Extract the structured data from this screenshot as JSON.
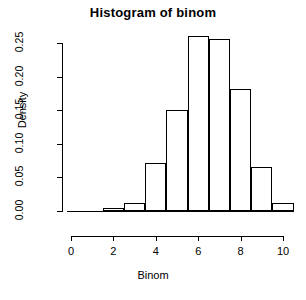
{
  "chart_data": {
    "type": "bar",
    "title": "Histogram of binom",
    "xlabel": "Binom",
    "ylabel": "Density",
    "grid": false,
    "legend": "none",
    "xlim": [
      0,
      10
    ],
    "ylim": [
      0,
      0.27
    ],
    "xticks": [
      0,
      2,
      4,
      6,
      8,
      10
    ],
    "xtick_labels": [
      "0",
      "2",
      "4",
      "6",
      "8",
      "10"
    ],
    "yticks": [
      0.0,
      0.05,
      0.1,
      0.15,
      0.2,
      0.25
    ],
    "ytick_labels": [
      "0.00",
      "0.05",
      "0.10",
      "0.15",
      "0.20",
      "0.25"
    ],
    "bin_edges": [
      1.5,
      2.5,
      3.5,
      4.5,
      5.5,
      6.5,
      7.5,
      8.5,
      9.5,
      10.5
    ],
    "bins": [
      {
        "label": "1.5-2.5",
        "x0": 1.5,
        "x1": 2.5,
        "density": 0.004
      },
      {
        "label": "2.5-3.5",
        "x0": 2.5,
        "x1": 3.5,
        "density": 0.012
      },
      {
        "label": "3.5-4.5",
        "x0": 3.5,
        "x1": 4.5,
        "density": 0.071
      },
      {
        "label": "4.5-5.5",
        "x0": 4.5,
        "x1": 5.5,
        "density": 0.151
      },
      {
        "label": "5.5-6.5",
        "x0": 5.5,
        "x1": 6.5,
        "density": 0.261
      },
      {
        "label": "6.5-7.5",
        "x0": 6.5,
        "x1": 7.5,
        "density": 0.256
      },
      {
        "label": "7.5-8.5",
        "x0": 7.5,
        "x1": 8.5,
        "density": 0.182
      },
      {
        "label": "8.5-9.5",
        "x0": 8.5,
        "x1": 9.5,
        "density": 0.066
      },
      {
        "label": "9.5-10.5",
        "x0": 9.5,
        "x1": 10.5,
        "density": 0.012
      }
    ],
    "values": [
      0.004,
      0.012,
      0.071,
      0.151,
      0.261,
      0.256,
      0.182,
      0.066,
      0.012
    ],
    "categories": [
      "1.5-2.5",
      "2.5-3.5",
      "3.5-4.5",
      "4.5-5.5",
      "5.5-6.5",
      "6.5-7.5",
      "7.5-8.5",
      "8.5-9.5",
      "9.5-10.5"
    ],
    "colors": {
      "background": "#ffffff",
      "axis": "#000000",
      "bar_fill": "transparent",
      "bar_border": "#000000",
      "text": "#000000"
    }
  }
}
